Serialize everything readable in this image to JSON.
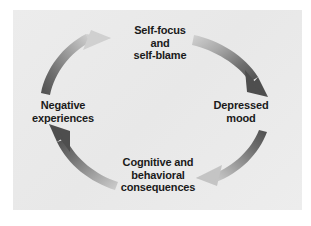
{
  "figure": {
    "type": "cycle-diagram",
    "background_color": "#ffffff",
    "panel_color": "#ebebeb",
    "text_color": "#1a1a1a",
    "arrow_dark_color": "#5a5a5a",
    "arrow_light_color": "#c9c9c9"
  },
  "diagram": {
    "title": "",
    "nodes": [
      {
        "id": "self-focus",
        "label": "Self-focus\nand\nself-blame",
        "position": "top"
      },
      {
        "id": "depressed-mood",
        "label": "Depressed\nmood",
        "position": "right"
      },
      {
        "id": "cognitive-behavioral",
        "label": "Cognitive and\nbehavioral\nconsequences",
        "position": "bottom"
      },
      {
        "id": "negative-experiences",
        "label": "Negative\nexperiences",
        "position": "left"
      }
    ],
    "arrows": [
      {
        "id": "arrow-top-right",
        "from": "self-focus",
        "to": "depressed-mood",
        "direction": "clockwise",
        "gradient": "light-to-dark"
      },
      {
        "id": "arrow-bottom-right",
        "from": "depressed-mood",
        "to": "cognitive-behavioral",
        "direction": "clockwise",
        "gradient": "dark-to-light"
      },
      {
        "id": "arrow-bottom-left",
        "from": "cognitive-behavioral",
        "to": "negative-experiences",
        "direction": "clockwise",
        "gradient": "light-to-dark"
      },
      {
        "id": "arrow-top-left",
        "from": "negative-experiences",
        "to": "self-focus",
        "direction": "clockwise",
        "gradient": "dark-to-light"
      }
    ]
  }
}
